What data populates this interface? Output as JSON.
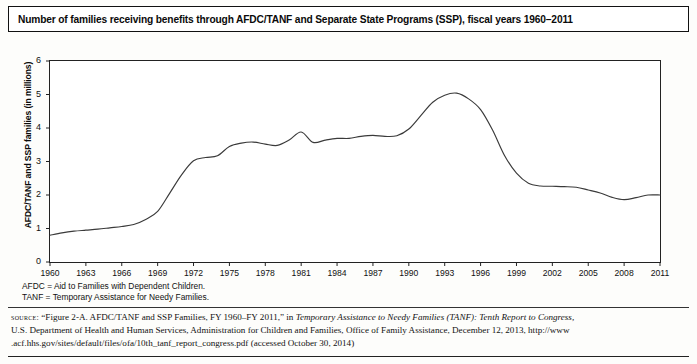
{
  "title": "Number of families receiving benefits through AFDC/TANF and Separate State Programs (SSP), fiscal years 1960–2011",
  "axis": {
    "ylabel": "AFDC/TANF and SSP families (in millions)"
  },
  "footnotes": [
    "AFDC = Aid to Families with Dependent Children.",
    "TANF = Temporary Assistance for Needy Families."
  ],
  "source": {
    "label": "source:",
    "line1_a": " “Figure 2-A. AFDC/TANF and SSP Families, FY 1960–FY 2011,” in ",
    "line1_italic": "Temporary Assistance to Needy Families (TANF): Tenth Report to Congress,",
    "line2": "U.S. Department of Health and Human Services, Administration for Children and Families, Office of Family Assistance, December 12, 2013, http://www",
    "line3": ".acf.hhs.gov/sites/default/files/ofa/10th_tanf_report_congress.pdf (accessed October 30, 2014)"
  },
  "chart_data": {
    "type": "line",
    "title": "Number of families receiving benefits through AFDC/TANF and Separate State Programs (SSP), fiscal years 1960–2011",
    "xlabel": "",
    "ylabel": "AFDC/TANF and SSP families (in millions)",
    "xlim": [
      1960,
      2011
    ],
    "ylim": [
      0,
      6
    ],
    "yticks": [
      0,
      1,
      2,
      3,
      4,
      5,
      6
    ],
    "xticks": [
      1960,
      1963,
      1966,
      1969,
      1972,
      1975,
      1978,
      1981,
      1984,
      1987,
      1990,
      1993,
      1996,
      1999,
      2002,
      2005,
      2008,
      2011
    ],
    "grid": false,
    "legend": "none",
    "series": [
      {
        "name": "AFDC/TANF and SSP families",
        "color": "#3a3a3a",
        "x": [
          1960,
          1961,
          1962,
          1963,
          1964,
          1965,
          1966,
          1967,
          1968,
          1969,
          1970,
          1971,
          1972,
          1973,
          1974,
          1975,
          1976,
          1977,
          1978,
          1979,
          1980,
          1981,
          1982,
          1983,
          1984,
          1985,
          1986,
          1987,
          1988,
          1989,
          1990,
          1991,
          1992,
          1993,
          1994,
          1995,
          1996,
          1997,
          1998,
          1999,
          2000,
          2001,
          2002,
          2003,
          2004,
          2005,
          2006,
          2007,
          2008,
          2009,
          2010,
          2011
        ],
        "values": [
          0.8,
          0.87,
          0.92,
          0.95,
          0.98,
          1.02,
          1.06,
          1.12,
          1.27,
          1.51,
          2.05,
          2.6,
          3.02,
          3.12,
          3.17,
          3.45,
          3.55,
          3.58,
          3.52,
          3.48,
          3.64,
          3.88,
          3.57,
          3.64,
          3.69,
          3.69,
          3.75,
          3.78,
          3.75,
          3.77,
          3.97,
          4.37,
          4.77,
          4.98,
          5.04,
          4.87,
          4.55,
          3.94,
          3.18,
          2.65,
          2.35,
          2.27,
          2.26,
          2.25,
          2.23,
          2.15,
          2.06,
          1.93,
          1.86,
          1.92,
          2.0,
          2.0
        ]
      }
    ]
  }
}
